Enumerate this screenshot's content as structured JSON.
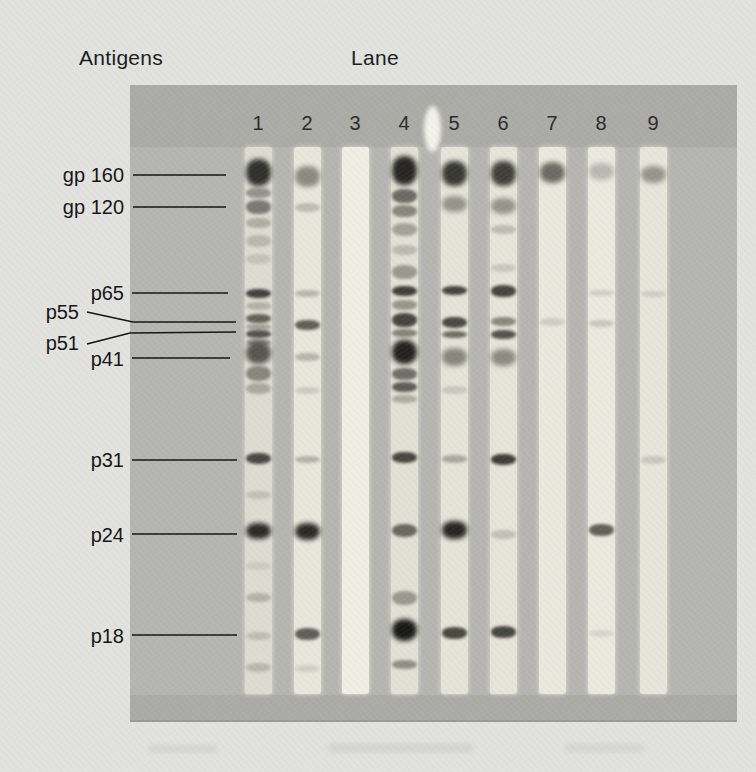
{
  "figure": {
    "antigens_label": "Antigens",
    "lane_label": "Lane",
    "lane_numbers": [
      "1",
      "2",
      "3",
      "4",
      "5",
      "6",
      "7",
      "8",
      "9"
    ]
  },
  "colors": {
    "page_bg": "#e2e3df",
    "blot_bg": "#b5b6b1",
    "blot_margin_bg": "#abaca7",
    "blot_edge": "#9a9b96",
    "leader_line": "#141414",
    "label_text": "#151515",
    "number_text": "#2b2b2b"
  },
  "antigens": [
    {
      "label": "gp 160",
      "tx": 124,
      "ty": 175,
      "line": [
        [
          133,
          175
        ],
        [
          226,
          175
        ]
      ]
    },
    {
      "label": "gp 120",
      "tx": 124,
      "ty": 207,
      "line": [
        [
          133,
          207
        ],
        [
          226,
          207
        ]
      ]
    },
    {
      "label": "p65",
      "tx": 124,
      "ty": 293,
      "line": [
        [
          132,
          293
        ],
        [
          228,
          293
        ]
      ]
    },
    {
      "label": "p55",
      "tx": 79,
      "ty": 312,
      "line": [
        [
          87,
          312
        ],
        [
          133,
          322
        ],
        [
          236,
          322
        ]
      ]
    },
    {
      "label": "p51",
      "tx": 79,
      "ty": 343,
      "line": [
        [
          87,
          344
        ],
        [
          130,
          333
        ],
        [
          236,
          332
        ]
      ]
    },
    {
      "label": "p41",
      "tx": 124,
      "ty": 359,
      "line": [
        [
          132,
          358
        ],
        [
          230,
          358
        ]
      ]
    },
    {
      "label": "p31",
      "tx": 124,
      "ty": 460,
      "line": [
        [
          132,
          460
        ],
        [
          237,
          460
        ]
      ]
    },
    {
      "label": "p24",
      "tx": 124,
      "ty": 535,
      "line": [
        [
          132,
          534
        ],
        [
          237,
          534
        ]
      ]
    },
    {
      "label": "p18",
      "tx": 124,
      "ty": 636,
      "line": [
        [
          132,
          635
        ],
        [
          237,
          635
        ]
      ]
    }
  ],
  "lanes": [
    {
      "number": "1",
      "x": 258,
      "tint": "#dedcd2",
      "bands": [
        {
          "y": 172,
          "h": 27,
          "c": "#232321",
          "a": 0.93
        },
        {
          "y": 193,
          "h": 10,
          "c": "#4b4b47",
          "a": 0.5
        },
        {
          "y": 207,
          "h": 14,
          "c": "#454541",
          "a": 0.65
        },
        {
          "y": 223,
          "h": 10,
          "c": "#6a6a64",
          "a": 0.4
        },
        {
          "y": 241,
          "h": 12,
          "c": "#78786f",
          "a": 0.35
        },
        {
          "y": 259,
          "h": 10,
          "c": "#83837b",
          "a": 0.28
        },
        {
          "y": 293,
          "h": 9,
          "c": "#2a2a27",
          "a": 0.88
        },
        {
          "y": 306,
          "h": 8,
          "c": "#6e6e66",
          "a": 0.38
        },
        {
          "y": 318,
          "h": 9,
          "c": "#38382f",
          "a": 0.75
        },
        {
          "y": 327,
          "h": 6,
          "c": "#5a5a52",
          "a": 0.45
        },
        {
          "y": 334,
          "h": 8,
          "c": "#31312c",
          "a": 0.8
        },
        {
          "y": 342,
          "h": 7,
          "c": "#4e4e47",
          "a": 0.55
        },
        {
          "y": 353,
          "h": 22,
          "c": "#3b3b33",
          "a": 0.82
        },
        {
          "y": 373,
          "h": 15,
          "c": "#4a4a42",
          "a": 0.58
        },
        {
          "y": 388,
          "h": 11,
          "c": "#62625a",
          "a": 0.42
        },
        {
          "y": 458,
          "h": 11,
          "c": "#2f2f2b",
          "a": 0.85
        },
        {
          "y": 495,
          "h": 8,
          "c": "#80807a",
          "a": 0.3
        },
        {
          "y": 531,
          "h": 16,
          "c": "#1f1f1d",
          "a": 0.95
        },
        {
          "y": 566,
          "h": 8,
          "c": "#8d8d86",
          "a": 0.22
        },
        {
          "y": 597,
          "h": 9,
          "c": "#7b7b74",
          "a": 0.42
        },
        {
          "y": 636,
          "h": 8,
          "c": "#83837c",
          "a": 0.35
        },
        {
          "y": 667,
          "h": 9,
          "c": "#7d7d76",
          "a": 0.38
        }
      ]
    },
    {
      "number": "2",
      "x": 307,
      "tint": "#e9e7dc",
      "bands": [
        {
          "y": 176,
          "h": 21,
          "c": "#4e4e48",
          "a": 0.6
        },
        {
          "y": 207,
          "h": 9,
          "c": "#7a7a72",
          "a": 0.38
        },
        {
          "y": 293,
          "h": 7,
          "c": "#70706a",
          "a": 0.4
        },
        {
          "y": 325,
          "h": 10,
          "c": "#3a3a33",
          "a": 0.78
        },
        {
          "y": 357,
          "h": 8,
          "c": "#73736b",
          "a": 0.42
        },
        {
          "y": 390,
          "h": 7,
          "c": "#84847c",
          "a": 0.28
        },
        {
          "y": 459,
          "h": 7,
          "c": "#6c6c66",
          "a": 0.42
        },
        {
          "y": 531,
          "h": 17,
          "c": "#1f1f1d",
          "a": 0.95
        },
        {
          "y": 634,
          "h": 12,
          "c": "#3a3a33",
          "a": 0.78
        },
        {
          "y": 668,
          "h": 7,
          "c": "#8b8b84",
          "a": 0.25
        }
      ]
    },
    {
      "number": "3",
      "x": 355,
      "tint": "#f1efe5",
      "bands": []
    },
    {
      "number": "4",
      "x": 404,
      "tint": "#e3e1d6",
      "bands": [
        {
          "y": 170,
          "h": 29,
          "c": "#1d1d1b",
          "a": 0.95
        },
        {
          "y": 196,
          "h": 14,
          "c": "#3f3f39",
          "a": 0.72
        },
        {
          "y": 211,
          "h": 12,
          "c": "#4c4c45",
          "a": 0.6
        },
        {
          "y": 229,
          "h": 13,
          "c": "#60605a",
          "a": 0.48
        },
        {
          "y": 250,
          "h": 10,
          "c": "#73736c",
          "a": 0.35
        },
        {
          "y": 272,
          "h": 14,
          "c": "#585851",
          "a": 0.52
        },
        {
          "y": 291,
          "h": 10,
          "c": "#292925",
          "a": 0.88
        },
        {
          "y": 305,
          "h": 10,
          "c": "#53534c",
          "a": 0.52
        },
        {
          "y": 320,
          "h": 14,
          "c": "#2b2b27",
          "a": 0.85
        },
        {
          "y": 333,
          "h": 8,
          "c": "#47473f",
          "a": 0.6
        },
        {
          "y": 352,
          "h": 24,
          "c": "#181816",
          "a": 0.95
        },
        {
          "y": 374,
          "h": 12,
          "c": "#3a3a33",
          "a": 0.68
        },
        {
          "y": 387,
          "h": 10,
          "c": "#31312b",
          "a": 0.75
        },
        {
          "y": 399,
          "h": 8,
          "c": "#5d5d55",
          "a": 0.4
        },
        {
          "y": 457,
          "h": 11,
          "c": "#2c2c28",
          "a": 0.85
        },
        {
          "y": 530,
          "h": 13,
          "c": "#3a3a33",
          "a": 0.72
        },
        {
          "y": 598,
          "h": 14,
          "c": "#53534c",
          "a": 0.5
        },
        {
          "y": 630,
          "h": 22,
          "c": "#131311",
          "a": 0.97
        },
        {
          "y": 664,
          "h": 9,
          "c": "#4c4c45",
          "a": 0.55
        }
      ]
    },
    {
      "number": "5",
      "x": 454,
      "tint": "#e6e4d9",
      "bands": [
        {
          "y": 173,
          "h": 25,
          "c": "#262622",
          "a": 0.9
        },
        {
          "y": 204,
          "h": 16,
          "c": "#53534c",
          "a": 0.55
        },
        {
          "y": 290,
          "h": 9,
          "c": "#292925",
          "a": 0.85
        },
        {
          "y": 322,
          "h": 11,
          "c": "#2e2e29",
          "a": 0.85
        },
        {
          "y": 334,
          "h": 7,
          "c": "#3b3b34",
          "a": 0.7
        },
        {
          "y": 357,
          "h": 18,
          "c": "#4b4b43",
          "a": 0.6
        },
        {
          "y": 390,
          "h": 8,
          "c": "#80807a",
          "a": 0.28
        },
        {
          "y": 459,
          "h": 8,
          "c": "#62625c",
          "a": 0.45
        },
        {
          "y": 530,
          "h": 18,
          "c": "#1b1b19",
          "a": 0.95
        },
        {
          "y": 633,
          "h": 12,
          "c": "#2e2e29",
          "a": 0.85
        }
      ]
    },
    {
      "number": "6",
      "x": 503,
      "tint": "#e7e5da",
      "bands": [
        {
          "y": 173,
          "h": 25,
          "c": "#2a2a26",
          "a": 0.88
        },
        {
          "y": 206,
          "h": 16,
          "c": "#53534c",
          "a": 0.55
        },
        {
          "y": 229,
          "h": 9,
          "c": "#74746c",
          "a": 0.35
        },
        {
          "y": 268,
          "h": 8,
          "c": "#7e7e76",
          "a": 0.28
        },
        {
          "y": 291,
          "h": 12,
          "c": "#292925",
          "a": 0.85
        },
        {
          "y": 321,
          "h": 9,
          "c": "#4c4c45",
          "a": 0.6
        },
        {
          "y": 334,
          "h": 9,
          "c": "#2f2f2a",
          "a": 0.8
        },
        {
          "y": 357,
          "h": 17,
          "c": "#4b4b43",
          "a": 0.58
        },
        {
          "y": 459,
          "h": 11,
          "c": "#272723",
          "a": 0.88
        },
        {
          "y": 534,
          "h": 9,
          "c": "#7e7e77",
          "a": 0.35
        },
        {
          "y": 632,
          "h": 12,
          "c": "#2b2b26",
          "a": 0.85
        }
      ]
    },
    {
      "number": "7",
      "x": 552,
      "tint": "#ebe9de",
      "bands": [
        {
          "y": 172,
          "h": 21,
          "c": "#3b3b34",
          "a": 0.72
        },
        {
          "y": 322,
          "h": 8,
          "c": "#8a8a83",
          "a": 0.28
        }
      ]
    },
    {
      "number": "8",
      "x": 601,
      "tint": "#ece9df",
      "bands": [
        {
          "y": 171,
          "h": 17,
          "c": "#70706a",
          "a": 0.4
        },
        {
          "y": 293,
          "h": 6,
          "c": "#8b8b84",
          "a": 0.28
        },
        {
          "y": 323,
          "h": 7,
          "c": "#7f7f78",
          "a": 0.32
        },
        {
          "y": 530,
          "h": 12,
          "c": "#3b3b34",
          "a": 0.78
        },
        {
          "y": 633,
          "h": 7,
          "c": "#93938c",
          "a": 0.22
        }
      ]
    },
    {
      "number": "9",
      "x": 653,
      "tint": "#e8e6db",
      "bands": [
        {
          "y": 174,
          "h": 17,
          "c": "#53534c",
          "a": 0.55
        },
        {
          "y": 294,
          "h": 6,
          "c": "#8a8a83",
          "a": 0.28
        },
        {
          "y": 460,
          "h": 8,
          "c": "#83837c",
          "a": 0.3
        }
      ]
    }
  ]
}
